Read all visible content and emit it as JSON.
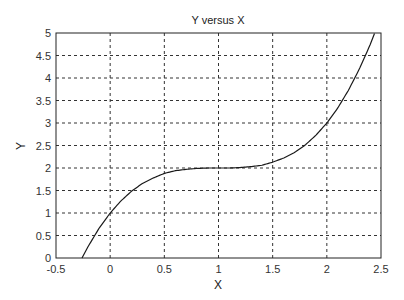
{
  "chart_data": {
    "type": "line",
    "title": "Y versus X",
    "xlabel": "X",
    "ylabel": "Y",
    "xlim": [
      -0.5,
      2.5
    ],
    "ylim": [
      0,
      5
    ],
    "xticks": [
      -0.5,
      0,
      0.5,
      1,
      1.5,
      2,
      2.5
    ],
    "xtick_labels": [
      "-0.5",
      "0",
      "0.5",
      "1",
      "1.5",
      "2",
      "2.5"
    ],
    "yticks": [
      0,
      0.5,
      1,
      1.5,
      2,
      2.5,
      3,
      3.5,
      4,
      4.5,
      5
    ],
    "ytick_labels": [
      "0",
      "0.5",
      "1",
      "1.5",
      "2",
      "2.5",
      "3",
      "3.5",
      "4",
      "4.5",
      "5"
    ],
    "grid": true,
    "legend": null,
    "series": [
      {
        "name": "Y",
        "x": [
          -0.26,
          -0.2,
          -0.1,
          0,
          0.1,
          0.2,
          0.3,
          0.4,
          0.5,
          0.6,
          0.7,
          0.8,
          0.9,
          1.0,
          1.1,
          1.2,
          1.3,
          1.4,
          1.5,
          1.6,
          1.7,
          1.8,
          1.9,
          2.0,
          2.1,
          2.2,
          2.3,
          2.4,
          2.44
        ],
        "y": [
          0.0,
          0.27,
          0.67,
          1.0,
          1.27,
          1.49,
          1.66,
          1.78,
          1.88,
          1.94,
          1.97,
          1.99,
          2.0,
          2.0,
          2.0,
          2.01,
          2.03,
          2.06,
          2.13,
          2.22,
          2.34,
          2.51,
          2.73,
          3.0,
          3.33,
          3.73,
          4.2,
          4.74,
          4.99
        ]
      }
    ],
    "color": "#000000"
  }
}
